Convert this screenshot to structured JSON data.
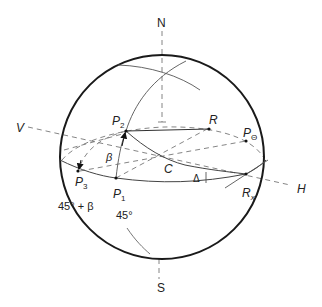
{
  "figure": {
    "type": "Poincare sphere diagram",
    "colors": {
      "outline": "#1a1a1a",
      "thin": "#555555",
      "dashed": "#777777",
      "text": "#222222",
      "background": "#ffffff"
    }
  },
  "labels": {
    "north": "N",
    "south": "S",
    "vertical": "V",
    "horizontal": "H",
    "p1": "P",
    "p1_sub": "1",
    "p2": "P",
    "p2_sub": "2",
    "p3": "P",
    "p3_sub": "3",
    "r": "R",
    "p_theta": "P",
    "p_theta_sub": "Θ",
    "rx": "R",
    "rx_sub": "x",
    "center": "C",
    "beta": "β",
    "delta": "Δ",
    "angle_45_plus_beta": "45° + β",
    "angle_45": "45°"
  }
}
